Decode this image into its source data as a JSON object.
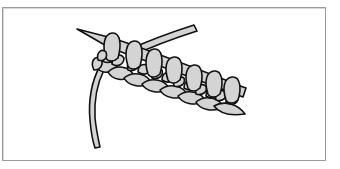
{
  "figure": {
    "colors": {
      "outline": "#111111",
      "fill": "#d4d4d4",
      "frame_border": "#9a9a9a",
      "background": "#ffffff"
    },
    "stitch_count": 7
  }
}
